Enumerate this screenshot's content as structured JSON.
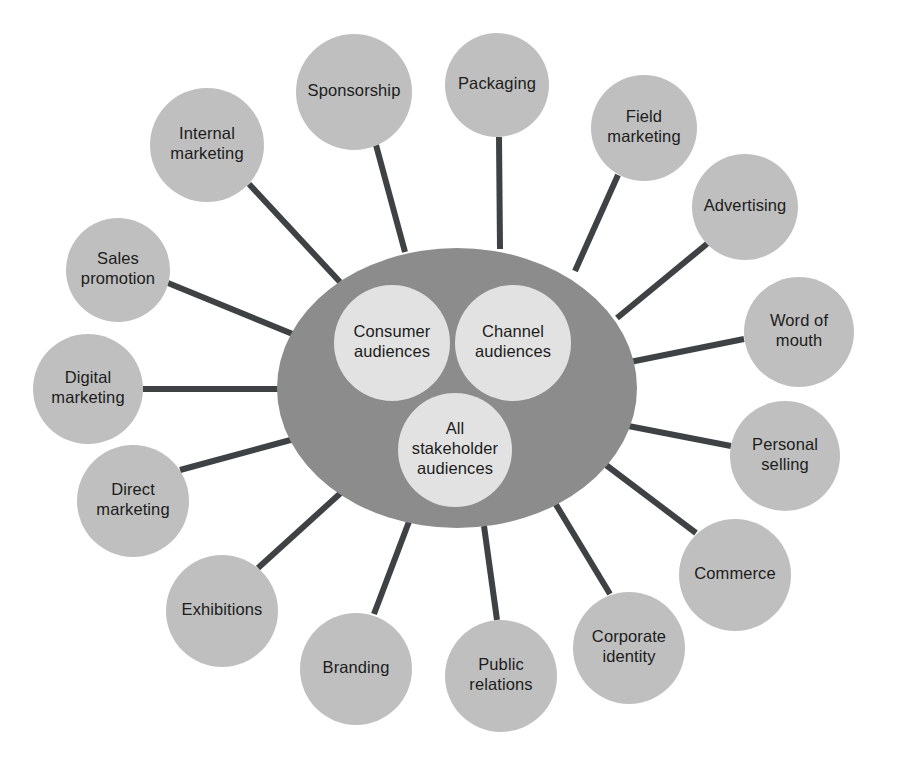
{
  "diagram": {
    "title": "Marketing communications mix radial diagram",
    "colors": {
      "background": "#ffffff",
      "hub_fill": "#8c8c8c",
      "inner_circle_fill": "#e2e2e2",
      "outer_circle_fill": "#bfbfbf",
      "spoke_stroke": "#3f4245",
      "label_text": "#1c1c1c"
    },
    "hub": {
      "cx": 457,
      "cy": 388,
      "rx": 180,
      "ry": 140
    },
    "inner_nodes": [
      {
        "id": "consumer-audiences",
        "lines": [
          "Consumer",
          "audiences"
        ],
        "cx": 392,
        "cy": 343,
        "r": 58
      },
      {
        "id": "channel-audiences",
        "lines": [
          "Channel",
          "audiences"
        ],
        "cx": 513,
        "cy": 343,
        "r": 58
      },
      {
        "id": "all-stakeholder-audiences",
        "lines": [
          "All",
          "stakeholder",
          "audiences"
        ],
        "cx": 455,
        "cy": 450,
        "r": 57
      }
    ],
    "outer_nodes": [
      {
        "id": "sponsorship",
        "lines": [
          "Sponsorship"
        ],
        "cx": 354,
        "cy": 92,
        "r": 58,
        "sx": 376,
        "sy": 145,
        "ex": 405,
        "ey": 252
      },
      {
        "id": "packaging",
        "lines": [
          "Packaging"
        ],
        "cx": 497,
        "cy": 85,
        "r": 52,
        "sx": 499,
        "sy": 137,
        "ex": 500,
        "ey": 249
      },
      {
        "id": "internal-marketing",
        "lines": [
          "Internal",
          "marketing"
        ],
        "cx": 207,
        "cy": 145,
        "r": 57,
        "sx": 249,
        "sy": 184,
        "ex": 340,
        "ey": 282
      },
      {
        "id": "field-marketing",
        "lines": [
          "Field",
          "marketing"
        ],
        "cx": 644,
        "cy": 128,
        "r": 53,
        "sx": 618,
        "sy": 175,
        "ex": 575,
        "ey": 271
      },
      {
        "id": "sales-promotion",
        "lines": [
          "Sales",
          "promotion"
        ],
        "cx": 118,
        "cy": 270,
        "r": 52,
        "sx": 168,
        "sy": 283,
        "ex": 300,
        "ey": 337
      },
      {
        "id": "advertising",
        "lines": [
          "Advertising"
        ],
        "cx": 745,
        "cy": 207,
        "r": 53,
        "sx": 708,
        "sy": 243,
        "ex": 617,
        "ey": 318
      },
      {
        "id": "digital-marketing",
        "lines": [
          "Digital",
          "marketing"
        ],
        "cx": 88,
        "cy": 389,
        "r": 55,
        "sx": 143,
        "sy": 389,
        "ex": 279,
        "ey": 389
      },
      {
        "id": "word-of-mouth",
        "lines": [
          "Word of",
          "mouth"
        ],
        "cx": 799,
        "cy": 332,
        "r": 55,
        "sx": 744,
        "sy": 339,
        "ex": 625,
        "ey": 363
      },
      {
        "id": "direct-marketing",
        "lines": [
          "Direct",
          "marketing"
        ],
        "cx": 133,
        "cy": 501,
        "r": 56,
        "sx": 180,
        "sy": 470,
        "ex": 298,
        "ey": 438
      },
      {
        "id": "personal-selling",
        "lines": [
          "Personal",
          "selling"
        ],
        "cx": 785,
        "cy": 456,
        "r": 55,
        "sx": 731,
        "sy": 446,
        "ex": 618,
        "ey": 424
      },
      {
        "id": "exhibitions",
        "lines": [
          "Exhibitions"
        ],
        "cx": 222,
        "cy": 611,
        "r": 56,
        "sx": 258,
        "sy": 568,
        "ex": 344,
        "ey": 490
      },
      {
        "id": "commerce",
        "lines": [
          "Commerce"
        ],
        "cx": 735,
        "cy": 575,
        "r": 56,
        "sx": 696,
        "sy": 533,
        "ex": 602,
        "ey": 462
      },
      {
        "id": "branding",
        "lines": [
          "Branding"
        ],
        "cx": 356,
        "cy": 669,
        "r": 56,
        "sx": 374,
        "sy": 614,
        "ex": 410,
        "ey": 519
      },
      {
        "id": "corporate-identity",
        "lines": [
          "Corporate",
          "identity"
        ],
        "cx": 629,
        "cy": 648,
        "r": 56,
        "sx": 610,
        "sy": 594,
        "ex": 555,
        "ey": 503
      },
      {
        "id": "public-relations",
        "lines": [
          "Public",
          "relations"
        ],
        "cx": 501,
        "cy": 676,
        "r": 56,
        "sx": 497,
        "sy": 620,
        "ex": 484,
        "ey": 526
      }
    ]
  }
}
